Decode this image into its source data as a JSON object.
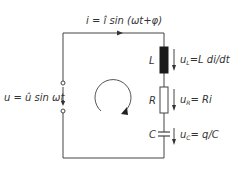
{
  "diagram": {
    "current_label": "i = î sin (ωt + φ)",
    "source_label": "u = û sin ωt",
    "components": [
      {
        "id": "L",
        "symbol": "L",
        "voltage_label": "u_L = L di/dt",
        "type": "inductor"
      },
      {
        "id": "R",
        "symbol": "R",
        "voltage_label": "u_R = Ri",
        "type": "resistor"
      },
      {
        "id": "C",
        "symbol": "C",
        "voltage_label": "u_C = q/C",
        "type": "capacitor"
      }
    ],
    "text": {
      "i_main": "i = î sin (ωt+φ)",
      "u_main": "u = û sin ωt",
      "L": "L",
      "uL_pre": "u",
      "uL_sub": "L",
      "uL_post": "=L di/dt",
      "R": "R",
      "uR_pre": "u",
      "uR_sub": "R",
      "uR_post": "= Ri",
      "C": "C",
      "uC_pre": "u",
      "uC_sub": "C",
      "uC_post": "= q/C"
    },
    "colors": {
      "line": "#444444",
      "inductor_fill": "#1a1a1a",
      "background": "#ffffff"
    }
  }
}
